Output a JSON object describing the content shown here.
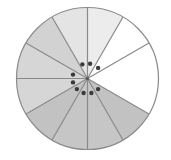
{
  "diagram": {
    "type": "fraction-circle",
    "center": [
      87.5,
      78.5
    ],
    "radius": 71,
    "outline_color": "#8a8a8a",
    "line_color": "#8a8a8a",
    "dot_color": "#3a3a3a",
    "dot_radius_from_center": 15,
    "dot_size": 2.2,
    "sectors": [
      {
        "start": 0,
        "end": 30,
        "fill": "#ececec"
      },
      {
        "start": 30,
        "end": 60,
        "fill": "#ffffff"
      },
      {
        "start": 60,
        "end": 120,
        "fill": "#ffffff"
      },
      {
        "start": 120,
        "end": 150,
        "fill": "#c2c2c2"
      },
      {
        "start": 150,
        "end": 180,
        "fill": "#c6c6c6"
      },
      {
        "start": 180,
        "end": 210,
        "fill": "#c6c6c6"
      },
      {
        "start": 210,
        "end": 240,
        "fill": "#c2c2c2"
      },
      {
        "start": 240,
        "end": 270,
        "fill": "#d6d6d6"
      },
      {
        "start": 270,
        "end": 300,
        "fill": "#d6d6d6"
      },
      {
        "start": 300,
        "end": 330,
        "fill": "#d2d2d2"
      },
      {
        "start": 330,
        "end": 360,
        "fill": "#e4e4e4"
      }
    ],
    "dots_angles": [
      340,
      10,
      45,
      285,
      255,
      225,
      195,
      165,
      135
    ]
  }
}
